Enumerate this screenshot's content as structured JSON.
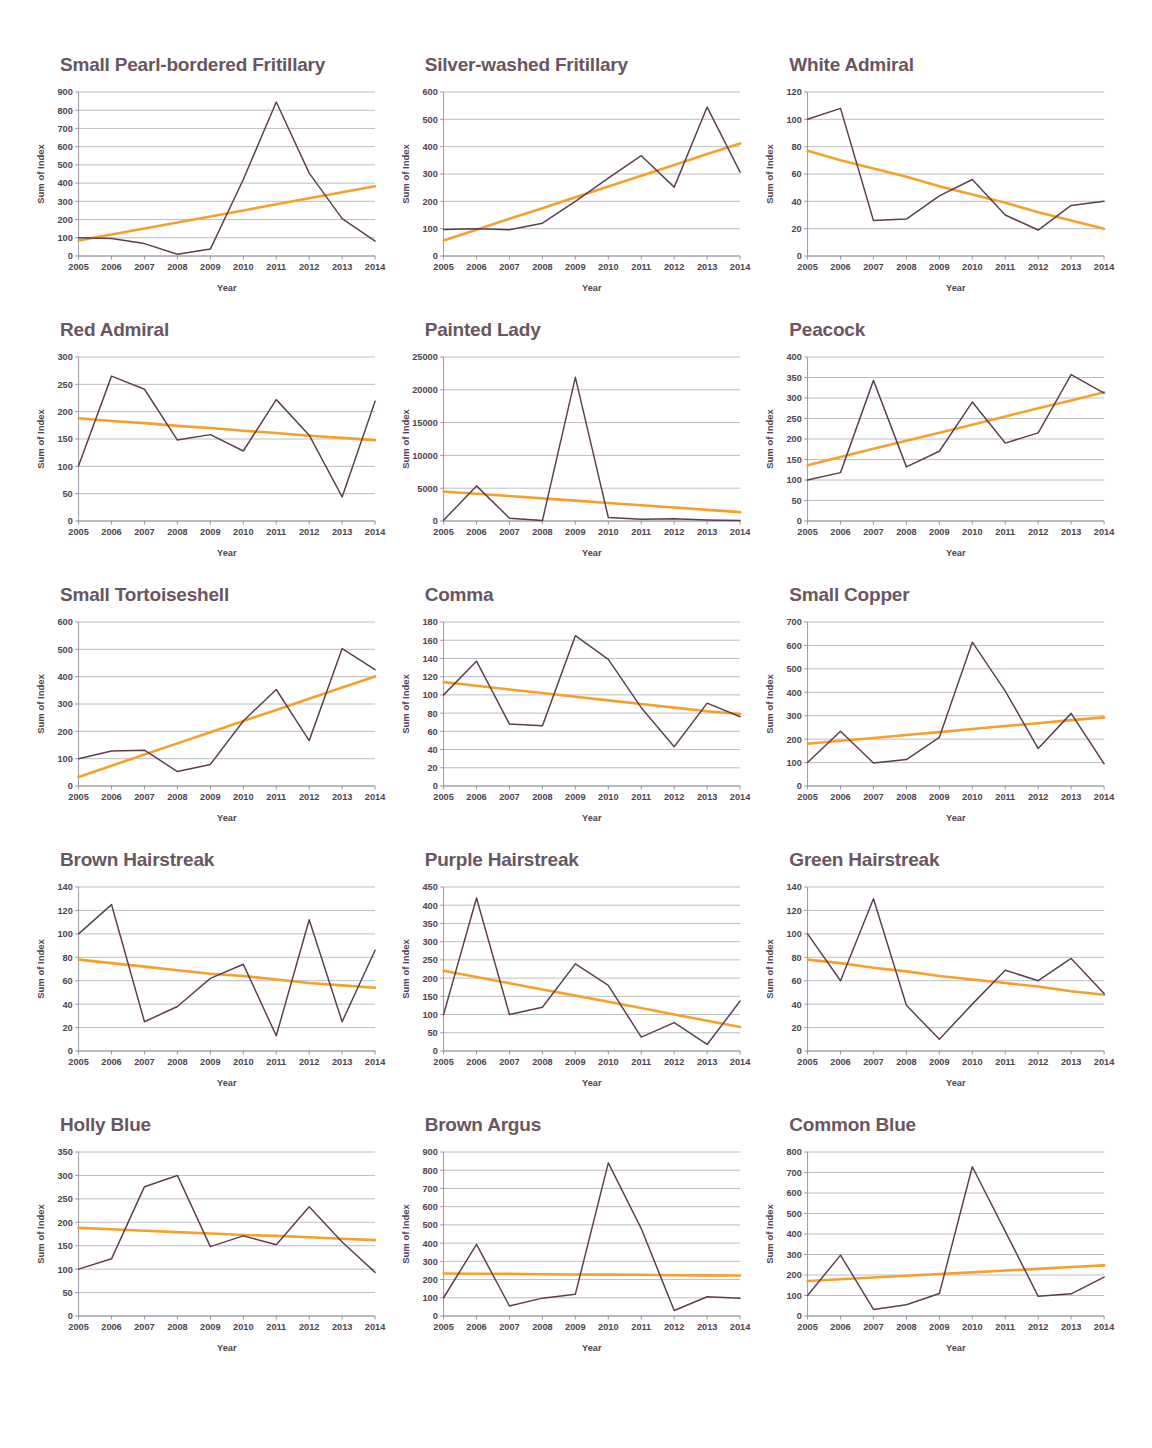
{
  "figure": {
    "axis": {
      "xlabel": "Year",
      "ylabel": "Sum of Index"
    },
    "colors": {
      "title": "#6b5561",
      "data_line": "#5d3c51",
      "trend_line": "#f5a02a",
      "gridline": "#9aa0ab",
      "background": "#ffffff"
    },
    "years": [
      2005,
      2006,
      2007,
      2008,
      2009,
      2010,
      2011,
      2012,
      2013,
      2014
    ]
  },
  "chart_data": [
    {
      "type": "line",
      "title": "Small Pearl-bordered Fritillary",
      "xlabel": "Year",
      "ylabel": "Sum of Index",
      "x": [
        2005,
        2006,
        2007,
        2008,
        2009,
        2010,
        2011,
        2012,
        2013,
        2014
      ],
      "categories": [
        "2005",
        "2006",
        "2007",
        "2008",
        "2009",
        "2010",
        "2011",
        "2012",
        "2013",
        "2014"
      ],
      "ylim": [
        0,
        900
      ],
      "yticks": [
        0,
        100,
        200,
        300,
        400,
        500,
        600,
        700,
        800,
        900
      ],
      "grid": true,
      "series": [
        {
          "name": "Sum of Index",
          "values": [
            100,
            96,
            68,
            10,
            38,
            420,
            845,
            455,
            205,
            82
          ]
        },
        {
          "name": "Linear trend",
          "values": [
            85,
            118,
            151,
            184,
            217,
            250,
            284,
            317,
            350,
            383
          ]
        }
      ]
    },
    {
      "type": "line",
      "title": "Silver-washed Fritillary",
      "xlabel": "Year",
      "ylabel": "Sum of Index",
      "x": [
        2005,
        2006,
        2007,
        2008,
        2009,
        2010,
        2011,
        2012,
        2013,
        2014
      ],
      "categories": [
        "2005",
        "2006",
        "2007",
        "2008",
        "2009",
        "2010",
        "2011",
        "2012",
        "2013",
        "2014"
      ],
      "ylim": [
        0,
        600
      ],
      "yticks": [
        0,
        100,
        200,
        300,
        400,
        500,
        600
      ],
      "grid": true,
      "series": [
        {
          "name": "Sum of Index",
          "values": [
            97,
            100,
            96,
            120,
            200,
            285,
            367,
            252,
            545,
            307
          ]
        },
        {
          "name": "Linear trend",
          "values": [
            57,
            96,
            136,
            175,
            215,
            254,
            294,
            333,
            373,
            412
          ]
        }
      ]
    },
    {
      "type": "line",
      "title": "White Admiral",
      "xlabel": "Year",
      "ylabel": "Sum of Index",
      "x": [
        2005,
        2006,
        2007,
        2008,
        2009,
        2010,
        2011,
        2012,
        2013,
        2014
      ],
      "categories": [
        "2005",
        "2006",
        "2007",
        "2008",
        "2009",
        "2010",
        "2011",
        "2012",
        "2013",
        "2014"
      ],
      "ylim": [
        0,
        120
      ],
      "yticks": [
        0,
        20,
        40,
        60,
        80,
        100,
        120
      ],
      "grid": true,
      "series": [
        {
          "name": "Sum of Index",
          "values": [
            100,
            108,
            26,
            27,
            44,
            56,
            30,
            19,
            37,
            40
          ]
        },
        {
          "name": "Linear trend",
          "values": [
            77,
            70,
            64,
            58,
            51,
            45,
            39,
            32,
            26,
            20
          ]
        }
      ]
    },
    {
      "type": "line",
      "title": "Red Admiral",
      "xlabel": "Year",
      "ylabel": "Sum of Index",
      "x": [
        2005,
        2006,
        2007,
        2008,
        2009,
        2010,
        2011,
        2012,
        2013,
        2014
      ],
      "categories": [
        "2005",
        "2006",
        "2007",
        "2008",
        "2009",
        "2010",
        "2011",
        "2012",
        "2013",
        "2014"
      ],
      "ylim": [
        0,
        300
      ],
      "yticks": [
        0,
        50,
        100,
        150,
        200,
        250,
        300
      ],
      "grid": true,
      "series": [
        {
          "name": "Sum of Index",
          "values": [
            101,
            265,
            241,
            148,
            158,
            128,
            222,
            157,
            44,
            219
          ]
        },
        {
          "name": "Linear trend",
          "values": [
            188,
            183,
            179,
            174,
            170,
            165,
            161,
            156,
            152,
            148
          ]
        }
      ]
    },
    {
      "type": "line",
      "title": "Painted Lady",
      "xlabel": "Year",
      "ylabel": "Sum of Index",
      "x": [
        2005,
        2006,
        2007,
        2008,
        2009,
        2010,
        2011,
        2012,
        2013,
        2014
      ],
      "categories": [
        "2005",
        "2006",
        "2007",
        "2008",
        "2009",
        "2010",
        "2011",
        "2012",
        "2013",
        "2014"
      ],
      "ylim": [
        0,
        25000
      ],
      "yticks": [
        0,
        5000,
        10000,
        15000,
        20000,
        25000
      ],
      "grid": true,
      "series": [
        {
          "name": "Sum of Index",
          "values": [
            100,
            5350,
            430,
            60,
            21900,
            540,
            260,
            350,
            170,
            60
          ]
        },
        {
          "name": "Linear trend",
          "values": [
            4500,
            4150,
            3800,
            3450,
            3100,
            2750,
            2400,
            2050,
            1700,
            1350
          ]
        }
      ]
    },
    {
      "type": "line",
      "title": "Peacock",
      "xlabel": "Year",
      "ylabel": "Sum of Index",
      "x": [
        2005,
        2006,
        2007,
        2008,
        2009,
        2010,
        2011,
        2012,
        2013,
        2014
      ],
      "categories": [
        "2005",
        "2006",
        "2007",
        "2008",
        "2009",
        "2010",
        "2011",
        "2012",
        "2013",
        "2014"
      ],
      "ylim": [
        0,
        400
      ],
      "yticks": [
        0,
        50,
        100,
        150,
        200,
        250,
        300,
        350,
        400
      ],
      "grid": true,
      "series": [
        {
          "name": "Sum of Index",
          "values": [
            100,
            118,
            343,
            132,
            170,
            290,
            190,
            215,
            357,
            312
          ]
        },
        {
          "name": "Linear trend",
          "values": [
            136,
            156,
            176,
            196,
            215,
            235,
            255,
            275,
            294,
            314
          ]
        }
      ]
    },
    {
      "type": "line",
      "title": "Small Tortoiseshell",
      "xlabel": "Year",
      "ylabel": "Sum of Index",
      "x": [
        2005,
        2006,
        2007,
        2008,
        2009,
        2010,
        2011,
        2012,
        2013,
        2014
      ],
      "categories": [
        "2005",
        "2006",
        "2007",
        "2008",
        "2009",
        "2010",
        "2011",
        "2012",
        "2013",
        "2014"
      ],
      "ylim": [
        0,
        600
      ],
      "yticks": [
        0,
        100,
        200,
        300,
        400,
        500,
        600
      ],
      "grid": true,
      "series": [
        {
          "name": "Sum of Index",
          "values": [
            100,
            128,
            131,
            53,
            79,
            238,
            353,
            166,
            503,
            426
          ]
        },
        {
          "name": "Linear trend",
          "values": [
            33,
            74,
            115,
            156,
            197,
            238,
            278,
            319,
            360,
            401
          ]
        }
      ]
    },
    {
      "type": "line",
      "title": "Comma",
      "xlabel": "Year",
      "ylabel": "Sum of Index",
      "x": [
        2005,
        2006,
        2007,
        2008,
        2009,
        2010,
        2011,
        2012,
        2013,
        2014
      ],
      "categories": [
        "2005",
        "2006",
        "2007",
        "2008",
        "2009",
        "2010",
        "2011",
        "2012",
        "2013",
        "2014"
      ],
      "ylim": [
        0,
        180
      ],
      "yticks": [
        0,
        20,
        40,
        60,
        80,
        100,
        120,
        140,
        160,
        180
      ],
      "grid": true,
      "series": [
        {
          "name": "Sum of Index",
          "values": [
            100,
            137,
            68,
            66,
            165,
            139,
            86,
            43,
            91,
            76
          ]
        },
        {
          "name": "Linear trend",
          "values": [
            114,
            110,
            106,
            102,
            98,
            94,
            90,
            86,
            82,
            79
          ]
        }
      ]
    },
    {
      "type": "line",
      "title": "Small Copper",
      "xlabel": "Year",
      "ylabel": "Sum of Index",
      "x": [
        2005,
        2006,
        2007,
        2008,
        2009,
        2010,
        2011,
        2012,
        2013,
        2014
      ],
      "categories": [
        "2005",
        "2006",
        "2007",
        "2008",
        "2009",
        "2010",
        "2011",
        "2012",
        "2013",
        "2014"
      ],
      "ylim": [
        0,
        700
      ],
      "yticks": [
        0,
        100,
        200,
        300,
        400,
        500,
        600,
        700
      ],
      "grid": true,
      "series": [
        {
          "name": "Sum of Index",
          "values": [
            100,
            234,
            98,
            113,
            208,
            614,
            405,
            160,
            310,
            95
          ]
        },
        {
          "name": "Linear trend",
          "values": [
            180,
            193,
            205,
            218,
            230,
            243,
            256,
            268,
            281,
            293
          ]
        }
      ]
    },
    {
      "type": "line",
      "title": "Brown Hairstreak",
      "xlabel": "Year",
      "ylabel": "Sum of Index",
      "x": [
        2005,
        2006,
        2007,
        2008,
        2009,
        2010,
        2011,
        2012,
        2013,
        2014
      ],
      "categories": [
        "2005",
        "2006",
        "2007",
        "2008",
        "2009",
        "2010",
        "2011",
        "2012",
        "2013",
        "2014"
      ],
      "ylim": [
        0,
        140
      ],
      "yticks": [
        0,
        20,
        40,
        60,
        80,
        100,
        120,
        140
      ],
      "grid": true,
      "series": [
        {
          "name": "Sum of Index",
          "values": [
            100,
            125,
            25,
            38,
            62,
            74,
            13,
            112,
            25,
            86
          ]
        },
        {
          "name": "Linear trend",
          "values": [
            78,
            75,
            72,
            69,
            66,
            64,
            61,
            58,
            56,
            54
          ]
        }
      ]
    },
    {
      "type": "line",
      "title": "Purple Hairstreak",
      "xlabel": "Year",
      "ylabel": "Sum of Index",
      "x": [
        2005,
        2006,
        2007,
        2008,
        2009,
        2010,
        2011,
        2012,
        2013,
        2014
      ],
      "categories": [
        "2005",
        "2006",
        "2007",
        "2008",
        "2009",
        "2010",
        "2011",
        "2012",
        "2013",
        "2014"
      ],
      "ylim": [
        0,
        450
      ],
      "yticks": [
        0,
        50,
        100,
        150,
        200,
        250,
        300,
        350,
        400,
        450
      ],
      "grid": true,
      "series": [
        {
          "name": "Sum of Index",
          "values": [
            100,
            420,
            100,
            120,
            239,
            180,
            38,
            78,
            18,
            137
          ]
        },
        {
          "name": "Linear trend",
          "values": [
            220,
            203,
            186,
            169,
            152,
            135,
            118,
            100,
            83,
            66
          ]
        }
      ]
    },
    {
      "type": "line",
      "title": "Green Hairstreak",
      "xlabel": "Year",
      "ylabel": "Sum of Index",
      "x": [
        2005,
        2006,
        2007,
        2008,
        2009,
        2010,
        2011,
        2012,
        2013,
        2014
      ],
      "categories": [
        "2005",
        "2006",
        "2007",
        "2008",
        "2009",
        "2010",
        "2011",
        "2012",
        "2013",
        "2014"
      ],
      "ylim": [
        0,
        140
      ],
      "yticks": [
        0,
        20,
        40,
        60,
        80,
        100,
        120,
        140
      ],
      "grid": true,
      "series": [
        {
          "name": "Sum of Index",
          "values": [
            100,
            60,
            130,
            39,
            10,
            40,
            69,
            60,
            79,
            49
          ]
        },
        {
          "name": "Linear trend",
          "values": [
            78,
            75,
            71,
            68,
            64,
            61,
            58,
            55,
            51,
            48
          ]
        }
      ]
    },
    {
      "type": "line",
      "title": "Holly Blue",
      "xlabel": "Year",
      "ylabel": "Sum of Index",
      "x": [
        2005,
        2006,
        2007,
        2008,
        2009,
        2010,
        2011,
        2012,
        2013,
        2014
      ],
      "categories": [
        "2005",
        "2006",
        "2007",
        "2008",
        "2009",
        "2010",
        "2011",
        "2012",
        "2013",
        "2014"
      ],
      "ylim": [
        0,
        350
      ],
      "yticks": [
        0,
        50,
        100,
        150,
        200,
        250,
        300,
        350
      ],
      "grid": true,
      "series": [
        {
          "name": "Sum of Index",
          "values": [
            100,
            122,
            276,
            300,
            148,
            171,
            152,
            233,
            158,
            93
          ]
        },
        {
          "name": "Linear trend",
          "values": [
            188,
            185,
            182,
            179,
            176,
            173,
            171,
            168,
            165,
            162
          ]
        }
      ]
    },
    {
      "type": "line",
      "title": "Brown Argus",
      "xlabel": "Year",
      "ylabel": "Sum of Index",
      "x": [
        2005,
        2006,
        2007,
        2008,
        2009,
        2010,
        2011,
        2012,
        2013,
        2014
      ],
      "categories": [
        "2005",
        "2006",
        "2007",
        "2008",
        "2009",
        "2010",
        "2011",
        "2012",
        "2013",
        "2014"
      ],
      "ylim": [
        0,
        900
      ],
      "yticks": [
        0,
        100,
        200,
        300,
        400,
        500,
        600,
        700,
        800,
        900
      ],
      "grid": true,
      "series": [
        {
          "name": "Sum of Index",
          "values": [
            100,
            393,
            55,
            98,
            120,
            840,
            480,
            30,
            106,
            97
          ]
        },
        {
          "name": "Linear trend",
          "values": [
            233,
            232,
            231,
            229,
            228,
            227,
            226,
            224,
            223,
            222
          ]
        }
      ]
    },
    {
      "type": "line",
      "title": "Common Blue",
      "xlabel": "Year",
      "ylabel": "Sum of Index",
      "x": [
        2005,
        2006,
        2007,
        2008,
        2009,
        2010,
        2011,
        2012,
        2013,
        2014
      ],
      "categories": [
        "2005",
        "2006",
        "2007",
        "2008",
        "2009",
        "2010",
        "2011",
        "2012",
        "2013",
        "2014"
      ],
      "ylim": [
        0,
        800
      ],
      "yticks": [
        0,
        100,
        200,
        300,
        400,
        500,
        600,
        700,
        800
      ],
      "grid": true,
      "series": [
        {
          "name": "Sum of Index",
          "values": [
            100,
            297,
            32,
            55,
            110,
            728,
            413,
            96,
            108,
            190
          ]
        },
        {
          "name": "Linear trend",
          "values": [
            171,
            179,
            188,
            196,
            205,
            213,
            222,
            230,
            239,
            247
          ]
        }
      ]
    }
  ]
}
